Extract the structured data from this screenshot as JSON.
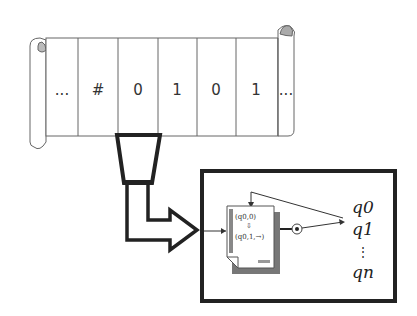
{
  "tape": {
    "cells": [
      "...",
      "#",
      "0",
      "1",
      "0",
      "1",
      "..."
    ]
  },
  "head": {
    "label": "read/write head"
  },
  "control": {
    "transition_input": "(q0,0)",
    "transition_arrow": "⇩",
    "transition_output": "(q0,1,→)",
    "states": [
      "q0",
      "q1",
      "⋮",
      "qn"
    ]
  },
  "colors": {
    "stroke": "#333333",
    "box": "#222222",
    "shadow": "#777777"
  }
}
